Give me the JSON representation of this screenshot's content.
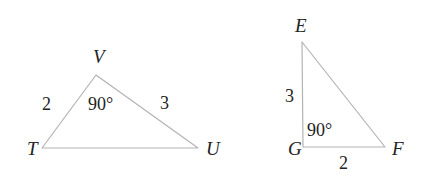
{
  "figure": {
    "background_color": "#ffffff",
    "stroke_color": "#b3b3b3",
    "text_color": "#232323"
  },
  "diagram_data": {
    "type": "geometry-diagram",
    "description": "Two triangles shown side by side, each marked with a 90 degree angle and two side lengths",
    "shapes": [
      {
        "name": "triangle-TVU",
        "vertices": [
          {
            "label": "T",
            "x": 42,
            "y": 148
          },
          {
            "label": "V",
            "x": 96,
            "y": 75
          },
          {
            "label": "U",
            "x": 198,
            "y": 148
          }
        ],
        "side_labels": [
          {
            "label": "2",
            "side": "TV"
          },
          {
            "label": "3",
            "side": "VU"
          }
        ],
        "angle_labels": [
          {
            "label": "90°",
            "at_vertex": "V"
          }
        ]
      },
      {
        "name": "triangle-EGF",
        "vertices": [
          {
            "label": "E",
            "x": 302,
            "y": 42
          },
          {
            "label": "G",
            "x": 303,
            "y": 147
          },
          {
            "label": "F",
            "x": 385,
            "y": 147
          }
        ],
        "side_labels": [
          {
            "label": "3",
            "side": "EG"
          },
          {
            "label": "2",
            "side": "GF"
          }
        ],
        "angle_labels": [
          {
            "label": "90°",
            "at_vertex": "G"
          }
        ]
      }
    ]
  },
  "left_triangle": {
    "vertex_T": "T",
    "vertex_V": "V",
    "vertex_U": "U",
    "side_TV": "2",
    "side_VU": "3",
    "angle_V": "90°"
  },
  "right_triangle": {
    "vertex_E": "E",
    "vertex_G": "G",
    "vertex_F": "F",
    "side_EG": "3",
    "side_GF": "2",
    "angle_G": "90°"
  }
}
